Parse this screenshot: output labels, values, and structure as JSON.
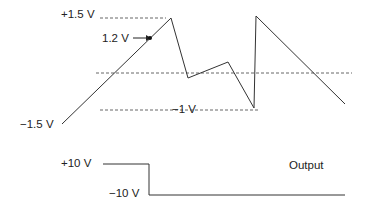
{
  "diagram": {
    "labels": {
      "plus_1_5": "+1.5 V",
      "v_1_2": "1.2 V",
      "minus_1_5": "−1.5 V",
      "minus_1": "−1 V",
      "plus_10": "+10 V",
      "minus_10": "−10 V",
      "output": "Output"
    },
    "colors": {
      "line": "#333333",
      "dash": "#555555",
      "text": "#222222"
    }
  }
}
